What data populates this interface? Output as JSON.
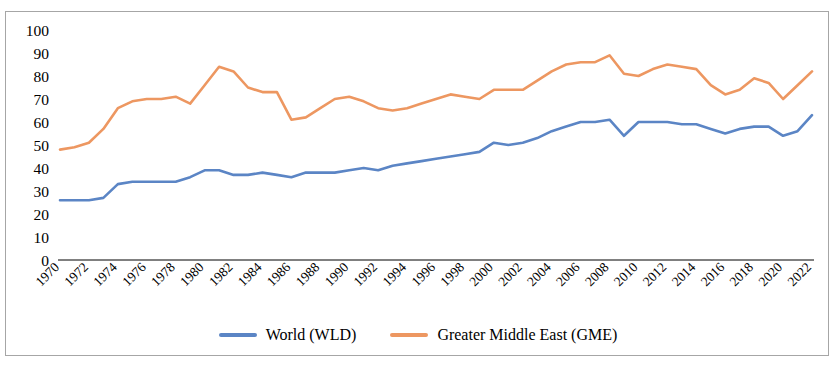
{
  "chart_data": {
    "type": "line",
    "title": "",
    "subtitle": "",
    "xlabel": "",
    "ylabel": "",
    "xlim": [
      1970,
      2022
    ],
    "ylim": [
      0,
      100
    ],
    "ytick_interval": 10,
    "xtick_interval": 2,
    "grid": false,
    "legend_position": "bottom",
    "yticks": [
      0,
      10,
      20,
      30,
      40,
      50,
      60,
      70,
      80,
      90,
      100
    ],
    "x": [
      1970,
      1971,
      1972,
      1973,
      1974,
      1975,
      1976,
      1977,
      1978,
      1979,
      1980,
      1981,
      1982,
      1983,
      1984,
      1985,
      1986,
      1987,
      1988,
      1989,
      1990,
      1991,
      1992,
      1993,
      1994,
      1995,
      1996,
      1997,
      1998,
      1999,
      2000,
      2001,
      2002,
      2003,
      2004,
      2005,
      2006,
      2007,
      2008,
      2009,
      2010,
      2011,
      2012,
      2013,
      2014,
      2015,
      2016,
      2017,
      2018,
      2019,
      2020,
      2021,
      2022
    ],
    "xtick_labels": [
      "1970",
      "1972",
      "1974",
      "1976",
      "1978",
      "1980",
      "1982",
      "1984",
      "1986",
      "1988",
      "1990",
      "1992",
      "1994",
      "1996",
      "1998",
      "2000",
      "2002",
      "2004",
      "2006",
      "2008",
      "2010",
      "2012",
      "2014",
      "2016",
      "2018",
      "2020",
      "2022"
    ],
    "series": [
      {
        "name": "World (WLD)",
        "color": "#5b85c5",
        "values": [
          26,
          26,
          26,
          27,
          33,
          34,
          34,
          34,
          34,
          36,
          39,
          39,
          37,
          37,
          38,
          37,
          36,
          38,
          38,
          38,
          39,
          40,
          39,
          41,
          42,
          43,
          44,
          45,
          46,
          47,
          51,
          50,
          51,
          53,
          56,
          58,
          60,
          60,
          61,
          54,
          60,
          60,
          60,
          59,
          59,
          57,
          55,
          57,
          58,
          58,
          54,
          56,
          63
        ]
      },
      {
        "name": "Greater Middle East (GME)",
        "color": "#ed9761",
        "values": [
          48,
          49,
          51,
          57,
          66,
          69,
          70,
          70,
          71,
          68,
          76,
          84,
          82,
          75,
          73,
          73,
          61,
          62,
          66,
          70,
          71,
          69,
          66,
          65,
          66,
          68,
          70,
          72,
          71,
          70,
          74,
          74,
          74,
          78,
          82,
          85,
          86,
          86,
          89,
          81,
          80,
          83,
          85,
          84,
          83,
          76,
          72,
          74,
          79,
          77,
          70,
          76,
          82
        ]
      }
    ]
  },
  "legend": {
    "items": [
      {
        "label": "World (WLD)",
        "color": "#5b85c5"
      },
      {
        "label": "Greater Middle East (GME)",
        "color": "#ed9761"
      }
    ]
  }
}
